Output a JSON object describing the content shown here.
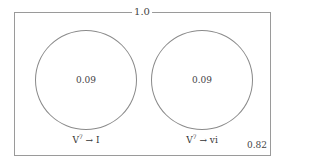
{
  "diagram": {
    "type": "venn",
    "universe_label": "1.0",
    "sets": [
      {
        "name": "V7→I",
        "label_base": "V",
        "label_sup": "7",
        "label_arrow": "→",
        "label_target": "I",
        "value": "0.09"
      },
      {
        "name": "V7→vi",
        "label_base": "V",
        "label_sup": "7",
        "label_arrow": "→",
        "label_target": "vi",
        "value": "0.09"
      }
    ],
    "outside_value": "0.82"
  },
  "colors": {
    "border": "#9a9a9a",
    "circle": "#8a8a8a",
    "text": "#333333",
    "background": "#ffffff"
  }
}
